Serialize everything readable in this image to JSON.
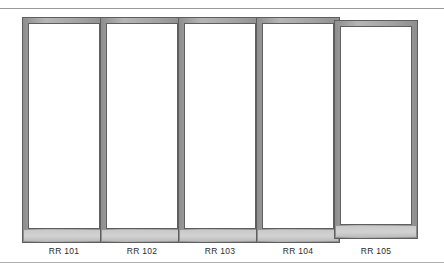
{
  "figure": {
    "type": "elevation-drawing",
    "panel_count": 5,
    "colors": {
      "frame_band": "#aaaaaa",
      "frame_outline": "#5e5e5e",
      "glass": "#ffffff",
      "sill": "#c9c9c9",
      "rule": "#9a9a9a",
      "label_text": "#2b2b2b"
    },
    "rules": {
      "top_label": "upper horizontal rule",
      "bottom_label": "lower horizontal rule"
    },
    "panels": [
      {
        "id": "panel-1",
        "label": "RR 101",
        "left": 22,
        "top": 9,
        "width": 84,
        "height": 226
      },
      {
        "id": "panel-2",
        "label": "RR 102",
        "left": 100,
        "top": 9,
        "width": 84,
        "height": 226
      },
      {
        "id": "panel-3",
        "label": "RR 103",
        "left": 178,
        "top": 9,
        "width": 84,
        "height": 226
      },
      {
        "id": "panel-4",
        "label": "RR 104",
        "left": 256,
        "top": 9,
        "width": 84,
        "height": 226
      },
      {
        "id": "panel-5",
        "label": "RR 105",
        "left": 334,
        "top": 12,
        "width": 84,
        "height": 219
      }
    ]
  }
}
